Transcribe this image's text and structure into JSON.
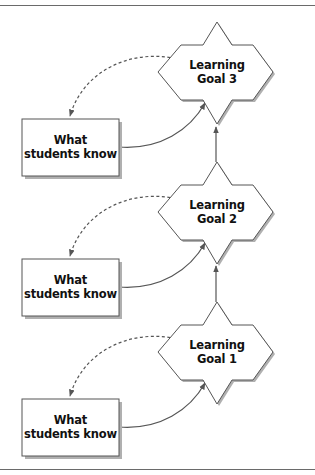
{
  "diagram": {
    "colors": {
      "stroke": "#555555",
      "shadow": "#b0b0b0",
      "fill": "#ffffff",
      "text": "#111111",
      "rule": "#6a6a6a"
    },
    "goals": [
      {
        "line1": "Learning",
        "line2": "Goal 3"
      },
      {
        "line1": "Learning",
        "line2": "Goal 2"
      },
      {
        "line1": "Learning",
        "line2": "Goal 1"
      }
    ],
    "knowledge_boxes": [
      {
        "line1": "What",
        "line2": "students know"
      },
      {
        "line1": "What",
        "line2": "students know"
      },
      {
        "line1": "What",
        "line2": "students know"
      }
    ],
    "connectors": {
      "solid_curve": "What students know → Learning Goal",
      "dashed_curve": "Learning Goal → What students know (feedback)",
      "vertical_arrow": "Learning Goal n → Learning Goal n+1"
    }
  }
}
